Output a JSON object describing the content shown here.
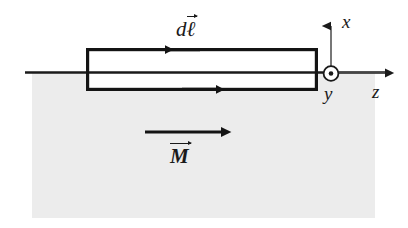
{
  "figure": {
    "background_color": "#ffffff"
  },
  "colors": {
    "slab_fill": "#ececec",
    "stroke": "#1a1a1a",
    "axis_stroke": "#555555",
    "loop_stroke": "#141414"
  },
  "slab": {
    "name": "magnetized-material-region",
    "x": 32,
    "y": 72,
    "width": 343,
    "height": 146,
    "fill": "#ececec"
  },
  "surface_line": {
    "name": "material-surface-line",
    "x1": 25,
    "y1": 72,
    "x2": 385,
    "y2": 72
  },
  "loop": {
    "name": "amperian-loop",
    "left": 86,
    "top": 48,
    "right": 318,
    "bottom": 91,
    "stroke_width": 3.2,
    "fill": "#ffffff",
    "top_arrow": {
      "direction": "left",
      "at_x": 166,
      "at_y": 48,
      "label": "dl-vector"
    },
    "bottom_arrow": {
      "direction": "right",
      "at_x": 214,
      "at_y": 91,
      "label": "current-direction"
    }
  },
  "labels": {
    "dl": {
      "base": "d",
      "symbol": "ℓ",
      "vector": true
    },
    "M": {
      "base": "",
      "symbol": "M",
      "vector": true
    },
    "x_axis": "x",
    "y_axis": "y",
    "z_axis": "z"
  },
  "magnetization_arrow": {
    "name": "magnetization-vector-arrow",
    "x1": 145,
    "y1": 132,
    "x2": 222,
    "y2": 132,
    "direction": "right",
    "label": "M"
  },
  "axes": {
    "origin": {
      "x": 331,
      "y": 73
    },
    "x_axis": {
      "name": "x-axis",
      "direction": "up",
      "from_y": 73,
      "to_y": 25,
      "label": "x"
    },
    "z_axis": {
      "name": "z-axis",
      "direction": "right",
      "from_x": 331,
      "to_x": 386,
      "label": "z"
    },
    "y_axis": {
      "name": "y-axis-out-of-page",
      "symbol": "circled-dot",
      "center_x": 331,
      "center_y": 73,
      "radius": 7.5,
      "dot_radius": 2.2,
      "label": "y"
    }
  }
}
